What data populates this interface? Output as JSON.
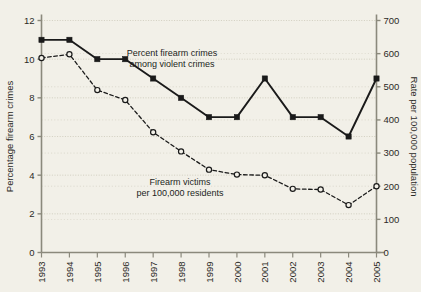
{
  "chart_data": {
    "type": "line",
    "title": "",
    "subtitle": "",
    "x": [
      1993,
      1994,
      1995,
      1996,
      1997,
      1998,
      1999,
      2000,
      2001,
      2002,
      2003,
      2004,
      2005
    ],
    "categories": [
      "1993",
      "1994",
      "1995",
      "1996",
      "1997",
      "1998",
      "1999",
      "2000",
      "2001",
      "2002",
      "2003",
      "2004",
      "2005"
    ],
    "xlabel": "",
    "ylabel": "Percentage firearm crimes",
    "y2label": "Rate per 100,000 population",
    "ylim": [
      0,
      12
    ],
    "y2lim": [
      0,
      700
    ],
    "yticks": [
      0,
      2,
      4,
      6,
      8,
      10,
      12
    ],
    "ytick_labels": [
      "0",
      "2",
      "4",
      "6",
      "8",
      "10",
      "12"
    ],
    "y2ticks": [
      0,
      100,
      200,
      300,
      400,
      500,
      600,
      700
    ],
    "y2tick_labels": [
      "0",
      "100",
      "200",
      "300",
      "400",
      "500",
      "600",
      "700"
    ],
    "grid": true,
    "legend_position": "inline-annotations",
    "series": [
      {
        "name": "Percent firearm crimes among violent crimes",
        "axis": "left",
        "style": "solid",
        "marker": "filled-square",
        "color": "#1a1a1a",
        "values": [
          11,
          11,
          10,
          10,
          9,
          8,
          7,
          7,
          9,
          7,
          7,
          6,
          9
        ]
      },
      {
        "name": "Firearm victims per 100,000 residents",
        "axis": "right",
        "style": "dashed",
        "marker": "open-circle",
        "color": "#1a1a1a",
        "values": [
          587,
          598,
          490,
          460,
          363,
          305,
          250,
          235,
          233,
          192,
          190,
          143,
          200
        ]
      }
    ],
    "annotations": [
      {
        "id": "annotation-percent-firearm-crimes",
        "lines": [
          "Percent firearm crimes",
          "among violent crimes"
        ],
        "x": 172,
        "y": 56
      },
      {
        "id": "annotation-firearm-victims",
        "lines": [
          "Firearm victims",
          "per 100,000 residents"
        ],
        "x": 180,
        "y": 185
      }
    ]
  },
  "colors": {
    "background": "#f2f0e8",
    "axis": "#8b897c",
    "grid": "#c9c6b6",
    "ink": "#1a1a1a",
    "text": "#2b2a26"
  }
}
